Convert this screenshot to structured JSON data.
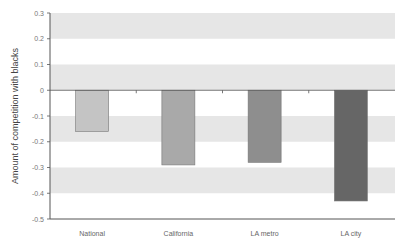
{
  "chart_data": {
    "type": "bar",
    "title": "",
    "xlabel": "",
    "ylabel": "Amount of competition with blacks",
    "categories": [
      "National",
      "California",
      "LA metro",
      "LA city"
    ],
    "values": [
      -0.16,
      -0.29,
      -0.28,
      -0.43
    ],
    "ylim": [
      -0.5,
      0.3
    ],
    "yticks": [
      0.3,
      0.2,
      0.1,
      0,
      -0.1,
      -0.2,
      -0.3,
      -0.4,
      -0.5
    ],
    "ytick_labels": [
      "0.3",
      "0.2",
      "0.1",
      "0",
      "-0.1",
      "-0.2",
      "-0.3",
      "-0.4",
      "-0.5"
    ],
    "bar_colors": [
      "#c4c4c4",
      "#a9a9a9",
      "#8e8e8e",
      "#666666"
    ],
    "band_color": "#e6e6e6",
    "grid": "alternating horizontal bands",
    "legend": null
  }
}
